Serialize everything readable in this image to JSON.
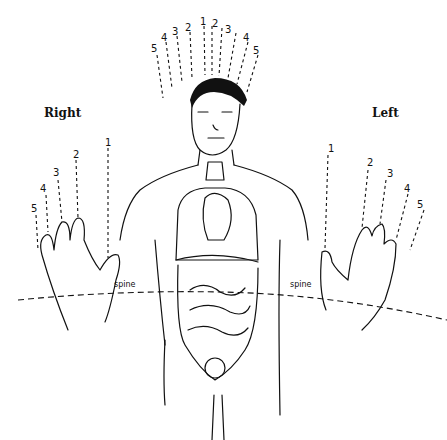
{
  "diagram": {
    "labels": {
      "right": "Right",
      "left": "Left",
      "spine_right": "spine",
      "spine_left": "spine"
    },
    "head_lines": {
      "left_side": [
        "5",
        "4",
        "3",
        "2",
        "1"
      ],
      "right_side": [
        "2",
        "3",
        "4",
        "5"
      ]
    },
    "right_hand_fingers": [
      "1",
      "2",
      "3",
      "4",
      "5"
    ],
    "left_hand_fingers": [
      "1",
      "2",
      "3",
      "4",
      "5"
    ],
    "figure": "human-torso-with-internal-organs",
    "colors": {
      "ink": "#111111",
      "background": "#ffffff"
    }
  }
}
